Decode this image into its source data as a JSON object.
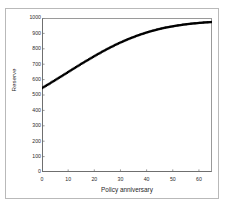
{
  "chart_data": {
    "type": "scatter",
    "title": "",
    "xlabel": "Policy anniversary",
    "ylabel": "Reserve",
    "xlim": [
      0,
      65
    ],
    "ylim": [
      0,
      1000
    ],
    "xticks": [
      0,
      10,
      20,
      30,
      40,
      50,
      60
    ],
    "yticks": [
      0,
      100,
      200,
      300,
      400,
      500,
      600,
      700,
      800,
      900,
      1000
    ],
    "grid": false,
    "legend": null,
    "marker": "filled-square",
    "marker_color": "#000000",
    "series": [
      {
        "name": "Reserve",
        "x": [
          0,
          1,
          2,
          3,
          4,
          5,
          6,
          7,
          8,
          9,
          10,
          11,
          12,
          13,
          14,
          15,
          16,
          17,
          18,
          19,
          20,
          21,
          22,
          23,
          24,
          25,
          26,
          27,
          28,
          29,
          30,
          31,
          32,
          33,
          34,
          35,
          36,
          37,
          38,
          39,
          40,
          41,
          42,
          43,
          44,
          45,
          46,
          47,
          48,
          49,
          50,
          51,
          52,
          53,
          54,
          55,
          56,
          57,
          58,
          59,
          60,
          61,
          62,
          63,
          64,
          65
        ],
        "y": [
          545,
          555,
          565,
          575,
          586,
          596,
          607,
          617,
          628,
          638,
          649,
          660,
          670,
          681,
          691,
          702,
          712,
          722,
          732,
          742,
          752,
          762,
          771,
          781,
          790,
          799,
          808,
          816,
          825,
          833,
          841,
          848,
          856,
          863,
          870,
          876,
          883,
          889,
          895,
          900,
          906,
          911,
          916,
          920,
          925,
          929,
          933,
          937,
          940,
          943,
          946,
          949,
          952,
          954,
          957,
          959,
          961,
          963,
          965,
          966,
          968,
          969,
          971,
          972,
          973,
          974
        ]
      }
    ]
  },
  "ytick_labels": [
    "1000",
    "900",
    "800",
    "700",
    "600",
    "500",
    "400",
    "300",
    "200",
    "100",
    "0"
  ],
  "xtick_labels": [
    "0",
    "10",
    "20",
    "30",
    "40",
    "50",
    "60"
  ]
}
